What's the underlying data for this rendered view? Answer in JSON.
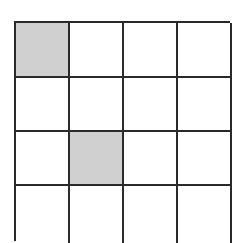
{
  "board": {
    "rows": 4,
    "cols": 4,
    "colors": {
      "filled": "#d0d0d0",
      "empty": "#ffffff",
      "line": "#2a2a2a"
    },
    "cells": [
      [
        1,
        0,
        0,
        0
      ],
      [
        0,
        0,
        0,
        0
      ],
      [
        0,
        1,
        0,
        0
      ],
      [
        0,
        0,
        0,
        0
      ]
    ]
  }
}
